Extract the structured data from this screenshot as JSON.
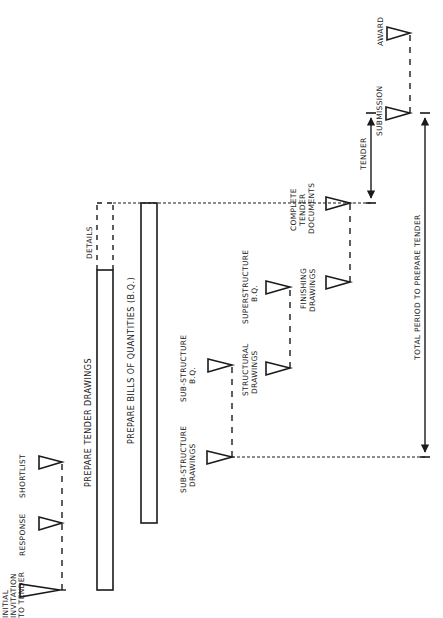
{
  "diagram": {
    "title": "",
    "orientation": "rotated 90° counter-clockwise; time runs bottom to top",
    "colors": {
      "ink": "#1a1a1a",
      "background": "#ffffff"
    },
    "milestones": [
      {
        "id": "initial",
        "lines": [
          "INITIAL",
          "INVITATION",
          "TO TENDER"
        ]
      },
      {
        "id": "response",
        "lines": [
          "RESPONSE"
        ]
      },
      {
        "id": "shortlist",
        "lines": [
          "SHORTLIST"
        ]
      },
      {
        "id": "substructure-drawings",
        "lines": [
          "SUB-STRUCTURE",
          "DRAWINGS"
        ]
      },
      {
        "id": "substructure-bq",
        "lines": [
          "SUB-STRUCTURE",
          "B.Q."
        ]
      },
      {
        "id": "structural-drawings",
        "lines": [
          "STRUCTURAL",
          "DRAWINGS"
        ]
      },
      {
        "id": "superstructure-bq",
        "lines": [
          "SUPERSTRUCTURE",
          "B.Q."
        ]
      },
      {
        "id": "finishing-drawings",
        "lines": [
          "FINISHING",
          "DRAWINGS"
        ]
      },
      {
        "id": "complete-tender-documents",
        "lines": [
          "COMPLETE",
          "TENDER",
          "DOCUMENTS"
        ]
      },
      {
        "id": "submission",
        "lines": [
          "SUBMISSION"
        ]
      },
      {
        "id": "award",
        "lines": [
          "AWARD"
        ]
      }
    ],
    "bars": [
      {
        "id": "tender-drawings",
        "label": "PREPARE TENDER DRAWINGS",
        "extension_label": "DETAILS"
      },
      {
        "id": "bills-of-quantities",
        "label": "PREPARE BILLS OF QUANTITIES (B.Q.)"
      }
    ],
    "spans": [
      {
        "id": "tender-period",
        "label": "TENDER"
      },
      {
        "id": "total-period",
        "label": "TOTAL PERIOD TO PREPARE TENDER"
      }
    ]
  }
}
